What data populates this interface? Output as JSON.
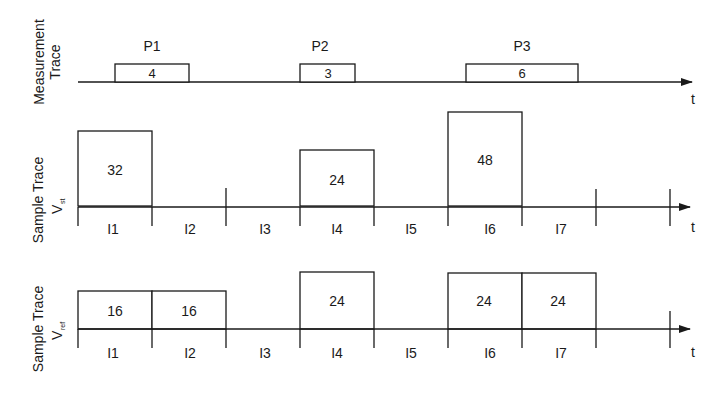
{
  "diagram": {
    "axis_label": "t",
    "measurement_trace": {
      "label_line1": "Measurement",
      "label_line2": "Trace",
      "pulses": [
        {
          "name": "P1",
          "value": "4"
        },
        {
          "name": "P2",
          "value": "3"
        },
        {
          "name": "P3",
          "value": "6"
        }
      ]
    },
    "vst_trace": {
      "label": "Sample Trace",
      "symbol": "V",
      "subscript": "st",
      "intervals": [
        "I1",
        "I2",
        "I3",
        "I4",
        "I5",
        "I6",
        "I7"
      ],
      "bars": [
        {
          "interval": "I1",
          "value": "32"
        },
        {
          "interval": "I4",
          "value": "24"
        },
        {
          "interval": "I6",
          "value": "48"
        }
      ]
    },
    "vref_trace": {
      "label": "Sample Trace",
      "symbol": "V",
      "subscript": "ref",
      "intervals": [
        "I1",
        "I2",
        "I3",
        "I4",
        "I5",
        "I6",
        "I7"
      ],
      "bars": [
        {
          "interval": "I1",
          "value": "16"
        },
        {
          "interval": "I2",
          "value": "16"
        },
        {
          "interval": "I4",
          "value": "24"
        },
        {
          "interval": "I6",
          "value": "24"
        },
        {
          "interval": "I7",
          "value": "24"
        }
      ]
    }
  }
}
